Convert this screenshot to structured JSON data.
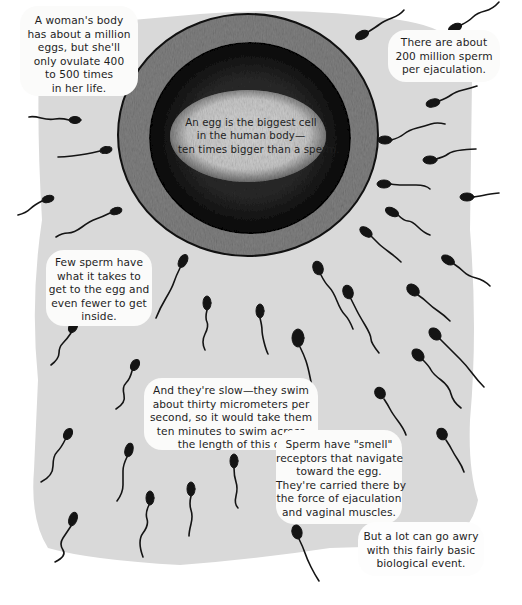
{
  "page": {
    "type": "illustrated infographic page",
    "colors": {
      "page_background": "#ffffff",
      "field_gray": "#d9d9d9",
      "bubble_fill": "#fbfbfa",
      "ink": "#141414",
      "egg_ring": "#7a7a7a",
      "egg_interior": "#0e0e0e",
      "egg_center": "#cfcfcf"
    }
  },
  "illustration": {
    "subject": "egg-cell-surrounded-by-sperm",
    "egg": {
      "center": [
        248,
        135
      ],
      "outer_radius": [
        130,
        121
      ],
      "inner_radius": [
        101,
        96
      ],
      "core_radius": [
        76,
        44
      ]
    }
  },
  "captions": {
    "egg_center": {
      "lines": [
        "An egg is the biggest cell",
        "in the human body—",
        "ten times bigger than a sperm."
      ]
    },
    "top_left": {
      "lines": [
        "A woman's body",
        "has about a million",
        "eggs, but she'll",
        "only ovulate 400",
        "to 500 times",
        "in her life."
      ]
    },
    "top_right": {
      "lines": [
        "There are about",
        "200 million sperm",
        "per ejaculation."
      ]
    },
    "middle_left": {
      "lines": [
        "Few sperm have",
        "what it takes to",
        "get to the egg and",
        "even fewer to get",
        "inside."
      ]
    },
    "center_slow": {
      "lines": [
        "And they're slow—they swim",
        "about thirty micrometers per",
        "second, so it would take them",
        "ten minutes to swim across"
      ],
      "last_line": "the length of this dot.",
      "arrow": "→",
      "dot": "·"
    },
    "smell_receptors": {
      "lines": [
        "Sperm have \"smell\"",
        "receptors that navigate",
        "toward the egg.",
        "They're carried there by",
        "the force of ejaculation",
        "and vaginal muscles."
      ]
    },
    "bottom_right": {
      "lines": [
        "But a lot can go awry",
        "with this fairly basic",
        "biological event."
      ]
    }
  }
}
